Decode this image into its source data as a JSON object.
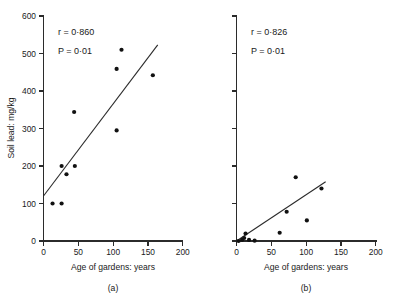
{
  "figure": {
    "background": "#ffffff",
    "ink_color": "#1a1a1a",
    "point_color": "#111111"
  },
  "chart_data": [
    {
      "type": "scatter",
      "panel": "(a)",
      "caption": "(a)",
      "title": "",
      "xlabel": "Age of gardens: years",
      "ylabel": "Soil lead: mg/kg",
      "xlim": [
        0,
        200
      ],
      "ylim": [
        0,
        600
      ],
      "xticks": [
        0,
        50,
        100,
        150,
        200
      ],
      "yticks": [
        0,
        100,
        200,
        300,
        400,
        500,
        600
      ],
      "xticklabels": [
        "0",
        "50",
        "100",
        "150",
        "200"
      ],
      "yticklabels": [
        "0",
        "100",
        "200",
        "300",
        "400",
        "500",
        "600"
      ],
      "grid": false,
      "legend": "none",
      "annotations": [
        {
          "name": "correlation",
          "symbol": "r",
          "relation": "=",
          "value": "0·860",
          "text": "r = 0·860"
        },
        {
          "name": "p-value",
          "symbol": "P",
          "relation": "=",
          "value": "0·01",
          "text": "P = 0·01"
        }
      ],
      "points": [
        {
          "x": 13,
          "y": 100
        },
        {
          "x": 26,
          "y": 100
        },
        {
          "x": 26,
          "y": 200
        },
        {
          "x": 33,
          "y": 178
        },
        {
          "x": 45,
          "y": 200
        },
        {
          "x": 44,
          "y": 344
        },
        {
          "x": 105,
          "y": 295
        },
        {
          "x": 105,
          "y": 459
        },
        {
          "x": 112,
          "y": 510
        },
        {
          "x": 157,
          "y": 442
        }
      ],
      "fit_line": {
        "x0": 0,
        "y0": 120,
        "x1": 164,
        "y1": 523
      }
    },
    {
      "type": "scatter",
      "panel": "(b)",
      "caption": "(b)",
      "title": "",
      "xlabel": "Age of gardens: years",
      "ylabel": "",
      "xlim": [
        0,
        200
      ],
      "ylim": [
        0,
        600
      ],
      "xticks": [
        0,
        50,
        100,
        150,
        200
      ],
      "yticks": [
        0,
        100,
        200,
        300,
        400,
        500,
        600
      ],
      "xticklabels": [
        "0",
        "50",
        "100",
        "150",
        "200"
      ],
      "yticklabels": [],
      "grid": false,
      "legend": "none",
      "annotations": [
        {
          "name": "correlation",
          "symbol": "r",
          "relation": "=",
          "value": "0·826",
          "text": "r = 0·826"
        },
        {
          "name": "p-value",
          "symbol": "P",
          "relation": "=",
          "value": "0·01",
          "text": "P = 0·01"
        }
      ],
      "points": [
        {
          "x": 3,
          "y": 0
        },
        {
          "x": 8,
          "y": 3
        },
        {
          "x": 11,
          "y": 8
        },
        {
          "x": 13,
          "y": 20
        },
        {
          "x": 18,
          "y": 3
        },
        {
          "x": 26,
          "y": 1
        },
        {
          "x": 62,
          "y": 22
        },
        {
          "x": 72,
          "y": 78
        },
        {
          "x": 85,
          "y": 170
        },
        {
          "x": 101,
          "y": 55
        },
        {
          "x": 122,
          "y": 140
        }
      ],
      "fit_line": {
        "x0": 0,
        "y0": 0,
        "x1": 128,
        "y1": 158
      }
    }
  ]
}
